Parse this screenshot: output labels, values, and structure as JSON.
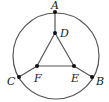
{
  "diagram": {
    "type": "geometry",
    "colors": {
      "stroke": "#555555",
      "point": "#111111",
      "label": "#222222",
      "background": "#ffffff"
    },
    "circle": {
      "cx": 56,
      "cy": 56,
      "r": 43
    },
    "points": [
      {
        "id": "A",
        "label": "A",
        "x": 55,
        "y": 12,
        "lx": 51,
        "ly": 9
      },
      {
        "id": "D",
        "label": "D",
        "x": 55,
        "y": 33,
        "lx": 60,
        "ly": 37
      },
      {
        "id": "F",
        "label": "F",
        "x": 37,
        "y": 66,
        "lx": 34,
        "ly": 82
      },
      {
        "id": "E",
        "label": "E",
        "x": 74,
        "y": 66,
        "lx": 71,
        "ly": 82
      },
      {
        "id": "C",
        "label": "C",
        "x": 19,
        "y": 77,
        "lx": 7,
        "ly": 85
      },
      {
        "id": "B",
        "label": "B",
        "x": 92,
        "y": 77,
        "lx": 96,
        "ly": 85
      }
    ],
    "segments": [
      [
        "A",
        "D"
      ],
      [
        "D",
        "F"
      ],
      [
        "D",
        "E"
      ],
      [
        "F",
        "E"
      ],
      [
        "C",
        "F"
      ],
      [
        "E",
        "B"
      ]
    ]
  }
}
